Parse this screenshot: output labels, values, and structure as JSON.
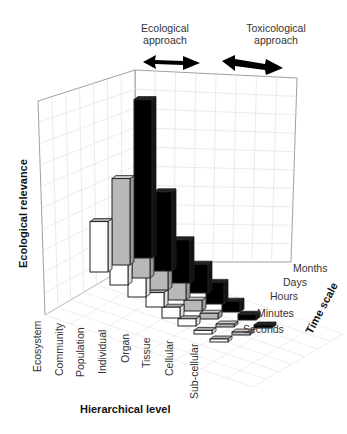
{
  "chart_data": {
    "type": "bar",
    "subtype": "3d-bar",
    "title": "",
    "xlabel": "Hierarchical level",
    "ylabel": "Ecological relevance",
    "zlabel": "Time scale",
    "categories": [
      "Ecosystem",
      "Community",
      "Population",
      "Individual",
      "Organ",
      "Tissue",
      "Cellular",
      "Sub-cellular"
    ],
    "z_categories": [
      "Months",
      "Days",
      "Hours",
      "Minutes",
      "Seconds"
    ],
    "series": [
      {
        "name": "front (white)",
        "color": "#ffffff",
        "values": [
          7,
          4,
          3,
          2,
          1.5,
          1,
          0.5,
          0.3
        ]
      },
      {
        "name": "middle (gray)",
        "color": "#b8b8b8",
        "values": [
          12,
          7,
          4,
          2.5,
          1.5,
          0.8,
          0.4,
          0.2
        ]
      },
      {
        "name": "back (black)",
        "color": "#000000",
        "values": [
          22,
          11,
          6,
          4,
          3,
          1.5,
          0.8,
          0.4
        ]
      }
    ],
    "annotations": [
      {
        "text": "Ecological approach",
        "arrow": "double-headed",
        "position": "top-left"
      },
      {
        "text": "Toxicological approach",
        "arrow": "double-headed",
        "position": "top-right"
      }
    ],
    "grid": true,
    "legend": "none"
  },
  "annotations": {
    "eco_line1": "Ecological",
    "eco_line2": "approach",
    "tox_line1": "Toxicological",
    "tox_line2": "approach"
  },
  "axes": {
    "ylabel": "Ecological relevance",
    "xlabel": "Hierarchical level",
    "zlabel": "Time scale",
    "xticks": [
      "Ecosystem",
      "Community",
      "Population",
      "Individual",
      "Organ",
      "Tissue",
      "Cellular",
      "Sub-cellular"
    ],
    "zticks": [
      "Months",
      "Days",
      "Hours",
      "Minutes",
      "Seconds"
    ]
  }
}
